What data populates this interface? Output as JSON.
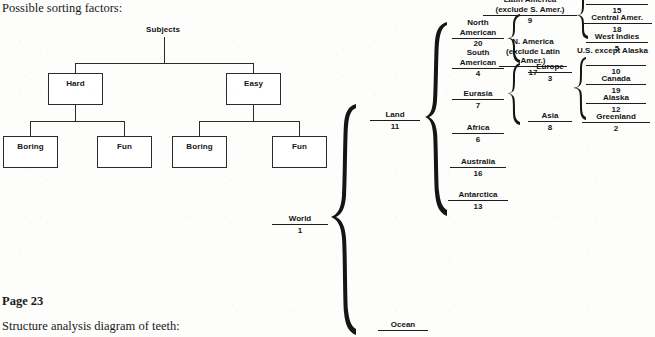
{
  "page": {
    "heading": "Possible sorting factors:",
    "page_marker": "Page 23",
    "next_caption": "Structure analysis diagram of teeth:"
  },
  "tree": {
    "root": "Subjects",
    "level1": [
      {
        "label": "Hard"
      },
      {
        "label": "Easy"
      }
    ],
    "level2": [
      {
        "label": "Boring"
      },
      {
        "label": "Fun"
      },
      {
        "label": "Boring"
      },
      {
        "label": "Fun"
      }
    ]
  },
  "brace_diagram": {
    "root": {
      "name": "World",
      "num": "1"
    },
    "level1": [
      {
        "name": "Land",
        "num": "11"
      },
      {
        "name": "Ocean",
        "num": ""
      }
    ],
    "land_children": [
      {
        "name": "North American",
        "num": "20"
      },
      {
        "name": "South American",
        "num": "4"
      },
      {
        "name": "Eurasia",
        "num": "7"
      },
      {
        "name": "Africa",
        "num": "6"
      },
      {
        "name": "Australia",
        "num": "16"
      },
      {
        "name": "Antarctica",
        "num": "13"
      }
    ],
    "north_american_children": [
      {
        "name": "Latin America (exclude S. Amer.)",
        "num": "9"
      },
      {
        "name": "N. America (exclude Latin Amer.)",
        "num": "17"
      }
    ],
    "eurasia_children": [
      {
        "name": "Europe",
        "num": "3"
      },
      {
        "name": "Asia",
        "num": "8"
      }
    ],
    "latin_america_children": [
      {
        "name": "",
        "num": "15"
      },
      {
        "name": "Central Amer.",
        "num": "18"
      },
      {
        "name": "West Indies",
        "num": "5"
      }
    ],
    "north_america_children": [
      {
        "name": "U.S. except Alaska",
        "num": "10"
      },
      {
        "name": "Canada",
        "num": "19"
      },
      {
        "name": "Alaska",
        "num": "12"
      },
      {
        "name": "Greenland",
        "num": "2"
      }
    ]
  },
  "colors": {
    "ink": "#151515",
    "rule": "#1d1d1d",
    "paper": "#fdfdfc"
  }
}
